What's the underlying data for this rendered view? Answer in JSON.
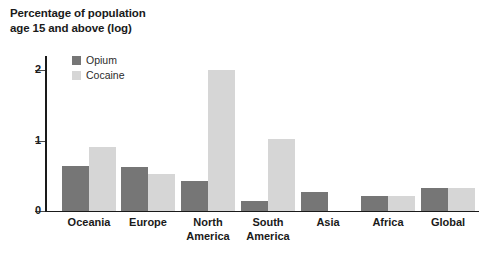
{
  "title": {
    "line1": "Percentage of population",
    "line2": "age 15 and above (log)"
  },
  "colors": {
    "opium": "#767676",
    "cocaine": "#d6d6d6",
    "axis": "#1a1a1a",
    "text": "#1a1a1a",
    "background": "#ffffff"
  },
  "legend": {
    "position": "top-left-inside",
    "items": [
      {
        "label": "Opium",
        "color": "#767676"
      },
      {
        "label": "Cocaine",
        "color": "#d6d6d6"
      }
    ]
  },
  "y_axis": {
    "ticks": [
      {
        "label": "0",
        "value": 0
      },
      {
        "label": "1",
        "value": 1
      },
      {
        "label": "2",
        "value": 2
      }
    ]
  },
  "chart_data": {
    "type": "bar",
    "title": "Percentage of population age 15 and above (log)",
    "xlabel": "",
    "ylabel": "Percentage of population age 15 and above (log)",
    "ylim": [
      0,
      2.2
    ],
    "grid": false,
    "legend_position": "top-left-inside",
    "categories": [
      "Oceania",
      "North\nAmerica",
      "Europe",
      "South\nAmerica",
      "Asia",
      "Africa",
      "Global"
    ],
    "categories_display": [
      "Oceania",
      "Europe",
      "North\nAmerica",
      "South\nAmerica",
      "Asia",
      "Africa",
      "Global"
    ],
    "series": [
      {
        "name": "Opium",
        "color": "#767676",
        "values": [
          0.64,
          0.63,
          0.42,
          0.14,
          0.27,
          0.21,
          0.33
        ]
      },
      {
        "name": "Cocaine",
        "color": "#d6d6d6",
        "values": [
          0.91,
          0.52,
          2.0,
          1.02,
          0.0,
          0.22,
          0.32
        ]
      }
    ],
    "tick_labels_y": [
      "0",
      "1",
      "2"
    ]
  }
}
